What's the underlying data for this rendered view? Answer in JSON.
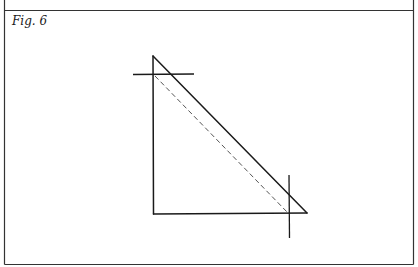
{
  "figure": {
    "label": "Fig. 6",
    "colors": {
      "stroke": "#1a1a1a",
      "dashed": "#555555",
      "border": "#333333",
      "background": "#ffffff"
    }
  }
}
